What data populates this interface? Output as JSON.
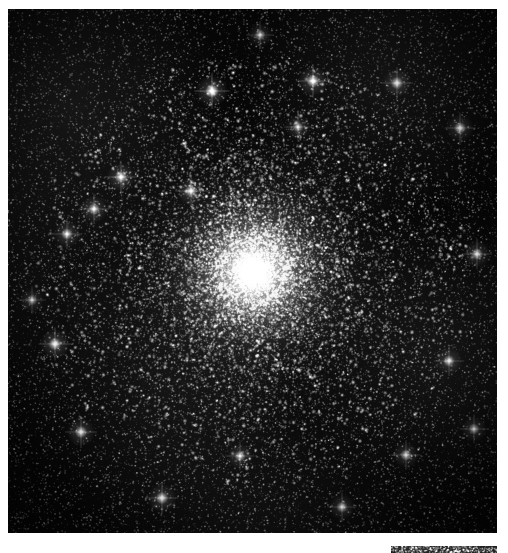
{
  "page": {
    "width": 508,
    "height": 553,
    "background_color": "#ffffff",
    "caption": ""
  },
  "main_image": {
    "name": "globular-cluster-plate",
    "subject": "globular star cluster",
    "rendering": "grayscale monochrome astronomical photograph",
    "alt_text": "Dense spherical globular star cluster with a brilliant unresolved core surrounded by thousands of resolved stars on a black sky field",
    "frame": {
      "x": 8,
      "y": 9,
      "width": 489,
      "height": 524
    },
    "background_color": "#060606",
    "star_color": "#ffffff",
    "core": {
      "center_x_pct": 50.2,
      "center_y_pct": 50.1,
      "peak_brightness": "#ffffff",
      "saturated_radius_px": 26,
      "halo_radius_px": 150
    }
  },
  "secondary_image": {
    "name": "image-strip-fragment",
    "subject": "partial second exposure strip",
    "alt_text": "Thin dark horizontal fragment of an adjacent astronomical exposure",
    "frame": {
      "x": 391,
      "y": 546,
      "width": 106,
      "height": 7
    },
    "background_color": "#101010"
  },
  "chart_data": {
    "type": "scatter",
    "title": "",
    "xlabel": "",
    "ylabel": "",
    "grid": false,
    "legend": "none",
    "xlim": [
      0,
      489
    ],
    "ylim": [
      0,
      524
    ],
    "bright_field_stars": [
      {
        "x": 204,
        "y": 82,
        "b": 1.0
      },
      {
        "x": 305,
        "y": 72,
        "b": 0.92
      },
      {
        "x": 113,
        "y": 168,
        "b": 0.88
      },
      {
        "x": 183,
        "y": 182,
        "b": 0.84
      },
      {
        "x": 86,
        "y": 200,
        "b": 0.8
      },
      {
        "x": 59,
        "y": 225,
        "b": 0.78
      },
      {
        "x": 47,
        "y": 335,
        "b": 0.9
      },
      {
        "x": 73,
        "y": 423,
        "b": 0.86
      },
      {
        "x": 154,
        "y": 489,
        "b": 0.88
      },
      {
        "x": 232,
        "y": 447,
        "b": 0.72
      },
      {
        "x": 290,
        "y": 118,
        "b": 0.7
      },
      {
        "x": 389,
        "y": 74,
        "b": 0.86
      },
      {
        "x": 452,
        "y": 119,
        "b": 0.82
      },
      {
        "x": 469,
        "y": 245,
        "b": 0.8
      },
      {
        "x": 441,
        "y": 352,
        "b": 0.78
      },
      {
        "x": 398,
        "y": 446,
        "b": 0.76
      },
      {
        "x": 334,
        "y": 498,
        "b": 0.74
      },
      {
        "x": 252,
        "y": 26,
        "b": 0.7
      },
      {
        "x": 24,
        "y": 291,
        "b": 0.68
      },
      {
        "x": 466,
        "y": 420,
        "b": 0.72
      }
    ],
    "radial_profile": {
      "radius_px": [
        0,
        15,
        30,
        50,
        75,
        100,
        130,
        165,
        205,
        250
      ],
      "brightness": [
        1.0,
        0.93,
        0.72,
        0.48,
        0.31,
        0.2,
        0.12,
        0.07,
        0.03,
        0.01
      ]
    }
  }
}
